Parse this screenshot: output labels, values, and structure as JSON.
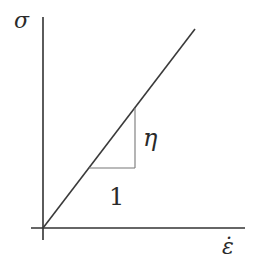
{
  "diagram": {
    "type": "stress-strain-rate linear plot",
    "y_axis_label": "σ",
    "x_axis_label": "ε̇",
    "slope_rise_label": "η",
    "slope_run_label": "1",
    "colors": {
      "background": "#ffffff",
      "axes": "#333333",
      "line": "#3a3a3a",
      "triangle": "#777777",
      "text": "#2a2a2a"
    }
  }
}
